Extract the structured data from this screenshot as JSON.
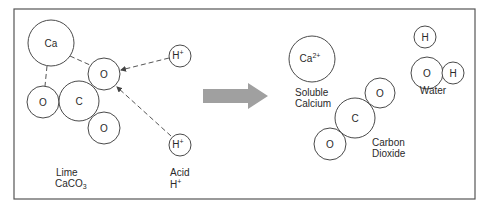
{
  "diagram": {
    "colors": {
      "frame": "#555555",
      "atom_stroke": "#4a4a4a",
      "arrow_fill": "#a0a0a0",
      "text": "#2a2a2a"
    },
    "reactants": {
      "lime": {
        "label": "Lime",
        "formula": "CaCO",
        "formula_sub": "3",
        "atoms": [
          {
            "id": "ca",
            "label": "Ca",
            "cx": 51,
            "cy": 43,
            "r": 23
          },
          {
            "id": "o_top",
            "label": "O",
            "cx": 104,
            "cy": 74,
            "r": 16
          },
          {
            "id": "o_left",
            "label": "O",
            "cx": 43,
            "cy": 102,
            "r": 16
          },
          {
            "id": "c",
            "label": "C",
            "cx": 79,
            "cy": 101,
            "r": 20
          },
          {
            "id": "o_bottom",
            "label": "O",
            "cx": 104,
            "cy": 128,
            "r": 16
          }
        ]
      },
      "acid": {
        "label": "Acid",
        "formula": "H",
        "formula_sup": "+",
        "atoms": [
          {
            "id": "h1",
            "label": "H",
            "sup": "+",
            "cx": 180,
            "cy": 56,
            "r": 11
          },
          {
            "id": "h2",
            "label": "H",
            "sup": "+",
            "cx": 180,
            "cy": 145,
            "r": 11
          }
        ]
      }
    },
    "products": {
      "calcium": {
        "label_line1": "Soluble",
        "label_line2": "Calcium",
        "atoms": [
          {
            "id": "ca2",
            "label": "Ca",
            "sup": "2+",
            "cx": 312,
            "cy": 59,
            "r": 23
          }
        ]
      },
      "carbon_dioxide": {
        "label_line1": "Carbon",
        "label_line2": "Dioxide",
        "atoms": [
          {
            "id": "co2_o1",
            "label": "O",
            "cx": 380,
            "cy": 93,
            "r": 15
          },
          {
            "id": "co2_c",
            "label": "C",
            "cx": 355,
            "cy": 118,
            "r": 20
          },
          {
            "id": "co2_o2",
            "label": "O",
            "cx": 330,
            "cy": 144,
            "r": 16
          }
        ]
      },
      "water": {
        "label": "Water",
        "atoms": [
          {
            "id": "w_h1",
            "label": "H",
            "cx": 425,
            "cy": 37,
            "r": 11
          },
          {
            "id": "w_o",
            "label": "O",
            "cx": 427,
            "cy": 73,
            "r": 16
          },
          {
            "id": "w_h2",
            "label": "H",
            "cx": 453,
            "cy": 73,
            "r": 11
          }
        ]
      }
    },
    "reaction_arrow": {
      "direction": "right"
    }
  }
}
